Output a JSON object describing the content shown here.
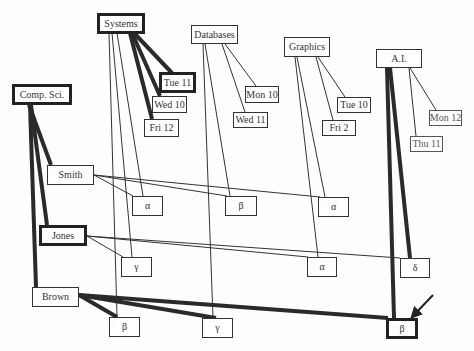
{
  "diagram": {
    "nodes": [
      {
        "id": "systems",
        "label": "Systems",
        "x": 97,
        "y": 13,
        "w": 48,
        "h": 21,
        "thick": true
      },
      {
        "id": "databases",
        "label": "Databases",
        "x": 191,
        "y": 25,
        "w": 47,
        "h": 19,
        "thick": false
      },
      {
        "id": "graphics",
        "label": "Graphics",
        "x": 284,
        "y": 37,
        "w": 46,
        "h": 20,
        "thick": false
      },
      {
        "id": "ai",
        "label": "A.I.",
        "x": 376,
        "y": 49,
        "w": 46,
        "h": 19,
        "thick": false
      },
      {
        "id": "tue11",
        "label": "Tue  11",
        "x": 159,
        "y": 72,
        "w": 37,
        "h": 21,
        "thick": true
      },
      {
        "id": "wed10",
        "label": "Wed 10",
        "x": 152,
        "y": 96,
        "w": 35,
        "h": 17,
        "thick": false
      },
      {
        "id": "fri12",
        "label": "Fri 12",
        "x": 144,
        "y": 119,
        "w": 35,
        "h": 18,
        "thick": false
      },
      {
        "id": "mon10",
        "label": "Mon 10",
        "x": 245,
        "y": 86,
        "w": 34,
        "h": 17,
        "thick": false
      },
      {
        "id": "wed11",
        "label": "Wed 11",
        "x": 233,
        "y": 112,
        "w": 35,
        "h": 16,
        "thick": false
      },
      {
        "id": "tue10",
        "label": "Tue 10",
        "x": 337,
        "y": 97,
        "w": 34,
        "h": 16,
        "thick": false
      },
      {
        "id": "fri2",
        "label": "Fri   2",
        "x": 322,
        "y": 120,
        "w": 34,
        "h": 16,
        "thick": false
      },
      {
        "id": "mon12",
        "label": "Mon 12",
        "x": 429,
        "y": 110,
        "w": 33,
        "h": 16,
        "thick": false,
        "faint": true
      },
      {
        "id": "thu11",
        "label": "Thu 11",
        "x": 410,
        "y": 136,
        "w": 33,
        "h": 16,
        "thick": false,
        "faint": true
      },
      {
        "id": "compsci",
        "label": "Comp. Sci.",
        "x": 12,
        "y": 84,
        "w": 60,
        "h": 21,
        "thick": true
      },
      {
        "id": "smith",
        "label": "Smith",
        "x": 47,
        "y": 165,
        "w": 47,
        "h": 20,
        "thick": false
      },
      {
        "id": "jones",
        "label": "Jones",
        "x": 39,
        "y": 225,
        "w": 48,
        "h": 21,
        "thick": true
      },
      {
        "id": "brown",
        "label": "Brown",
        "x": 32,
        "y": 287,
        "w": 47,
        "h": 20,
        "thick": false
      },
      {
        "id": "alpha1",
        "label": "α",
        "x": 132,
        "y": 196,
        "w": 31,
        "h": 20,
        "thick": false
      },
      {
        "id": "beta1",
        "label": "β",
        "x": 225,
        "y": 196,
        "w": 32,
        "h": 20,
        "thick": false
      },
      {
        "id": "alpha2",
        "label": "α",
        "x": 318,
        "y": 197,
        "w": 31,
        "h": 20,
        "thick": false
      },
      {
        "id": "gamma1",
        "label": "γ",
        "x": 121,
        "y": 257,
        "w": 31,
        "h": 20,
        "thick": false
      },
      {
        "id": "alpha3",
        "label": "α",
        "x": 307,
        "y": 257,
        "w": 30,
        "h": 20,
        "thick": false
      },
      {
        "id": "delta",
        "label": "δ",
        "x": 400,
        "y": 258,
        "w": 30,
        "h": 20,
        "thick": false
      },
      {
        "id": "beta2",
        "label": "β",
        "x": 109,
        "y": 317,
        "w": 31,
        "h": 20,
        "thick": false
      },
      {
        "id": "gamma2",
        "label": "γ",
        "x": 202,
        "y": 318,
        "w": 31,
        "h": 20,
        "thick": false
      },
      {
        "id": "beta3",
        "label": "β",
        "x": 386,
        "y": 318,
        "w": 32,
        "h": 21,
        "thick": true
      }
    ],
    "edges": [
      {
        "x1": 134,
        "y1": 33,
        "x2": 172,
        "y2": 73,
        "w": 4
      },
      {
        "x1": 132,
        "y1": 33,
        "x2": 160,
        "y2": 96,
        "w": 4
      },
      {
        "x1": 130,
        "y1": 33,
        "x2": 152,
        "y2": 119,
        "w": 4
      },
      {
        "x1": 109,
        "y1": 33,
        "x2": 117,
        "y2": 317,
        "w": 1
      },
      {
        "x1": 112,
        "y1": 33,
        "x2": 132,
        "y2": 257,
        "w": 1
      },
      {
        "x1": 117,
        "y1": 33,
        "x2": 143,
        "y2": 196,
        "w": 1
      },
      {
        "x1": 225,
        "y1": 44,
        "x2": 256,
        "y2": 86,
        "w": 1
      },
      {
        "x1": 222,
        "y1": 44,
        "x2": 245,
        "y2": 112,
        "w": 1
      },
      {
        "x1": 203,
        "y1": 44,
        "x2": 213,
        "y2": 318,
        "w": 1
      },
      {
        "x1": 205,
        "y1": 44,
        "x2": 230,
        "y2": 196,
        "w": 1
      },
      {
        "x1": 318,
        "y1": 57,
        "x2": 345,
        "y2": 97,
        "w": 1
      },
      {
        "x1": 316,
        "y1": 57,
        "x2": 333,
        "y2": 120,
        "w": 1
      },
      {
        "x1": 295,
        "y1": 57,
        "x2": 318,
        "y2": 257,
        "w": 1
      },
      {
        "x1": 297,
        "y1": 57,
        "x2": 325,
        "y2": 197,
        "w": 1
      },
      {
        "x1": 410,
        "y1": 68,
        "x2": 436,
        "y2": 110,
        "w": 1
      },
      {
        "x1": 409,
        "y1": 68,
        "x2": 416,
        "y2": 136,
        "w": 1
      },
      {
        "x1": 387,
        "y1": 68,
        "x2": 394,
        "y2": 318,
        "w": 4
      },
      {
        "x1": 390,
        "y1": 68,
        "x2": 410,
        "y2": 258,
        "w": 4
      },
      {
        "x1": 29,
        "y1": 105,
        "x2": 51,
        "y2": 165,
        "w": 4
      },
      {
        "x1": 31,
        "y1": 105,
        "x2": 47,
        "y2": 225,
        "w": 4
      },
      {
        "x1": 30,
        "y1": 105,
        "x2": 36,
        "y2": 287,
        "w": 4
      },
      {
        "x1": 94,
        "y1": 175,
        "x2": 133,
        "y2": 196,
        "w": 1
      },
      {
        "x1": 94,
        "y1": 175,
        "x2": 227,
        "y2": 196,
        "w": 1
      },
      {
        "x1": 94,
        "y1": 175,
        "x2": 320,
        "y2": 197,
        "w": 1
      },
      {
        "x1": 87,
        "y1": 236,
        "x2": 123,
        "y2": 257,
        "w": 1
      },
      {
        "x1": 87,
        "y1": 236,
        "x2": 308,
        "y2": 257,
        "w": 1
      },
      {
        "x1": 87,
        "y1": 236,
        "x2": 400,
        "y2": 258,
        "w": 1
      },
      {
        "x1": 79,
        "y1": 295,
        "x2": 117,
        "y2": 317,
        "w": 4
      },
      {
        "x1": 79,
        "y1": 295,
        "x2": 216,
        "y2": 318,
        "w": 4
      },
      {
        "x1": 79,
        "y1": 295,
        "x2": 388,
        "y2": 318,
        "w": 4
      }
    ],
    "arrow": {
      "x1": 433,
      "y1": 295,
      "x2": 413,
      "y2": 316,
      "label": "pointer-arrow"
    }
  }
}
